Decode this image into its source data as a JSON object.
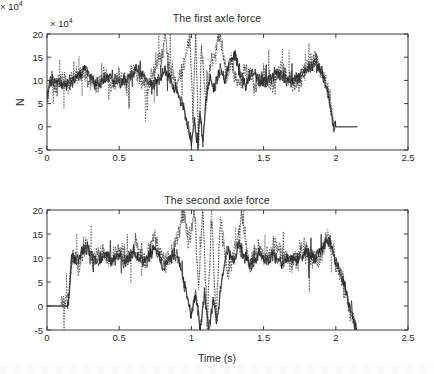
{
  "figure": {
    "background": "#ffffff",
    "ink_color": "#1c1c1c",
    "axis_color": "#3a3a3a"
  },
  "chart_data": [
    {
      "type": "line",
      "title": "The first axle force",
      "xlabel": "",
      "ylabel": "N",
      "y_exponent_label": "× 10",
      "y_exponent_power": "4",
      "xlim": [
        0,
        2.5
      ],
      "ylim": [
        -5,
        20
      ],
      "xticks": [
        "0",
        "0.5",
        "1",
        "1.5",
        "2",
        "2.5"
      ],
      "xtick_values": [
        0,
        0.5,
        1,
        1.5,
        2,
        2.5
      ],
      "yticks": [
        "20",
        "15",
        "10",
        "5",
        "0",
        "-5"
      ],
      "ytick_values": [
        20,
        15,
        10,
        5,
        0,
        -5
      ],
      "grid": false,
      "legend": null,
      "series": [
        {
          "name": "measured-force-solid",
          "style": "solid",
          "description": "Noisy oscillating axle force signal starting near 7-10 at t=0, fluctuating about a mean of ~9-10 with heavy scatter, violent oscillation clipping the -5 to 20 bounds between t=0.95 and t=1.3, recovering to ~10 mean until t=1.97, then dropping abruptly to 0 and flat to t=2.15",
          "x": [
            0,
            0.02,
            0.05,
            0.08,
            0.12,
            0.16,
            0.2,
            0.24,
            0.27,
            0.3,
            0.34,
            0.38,
            0.42,
            0.46,
            0.5,
            0.54,
            0.58,
            0.62,
            0.66,
            0.7,
            0.74,
            0.78,
            0.82,
            0.86,
            0.9,
            0.94,
            0.97,
            1.0,
            1.02,
            1.04,
            1.06,
            1.08,
            1.1,
            1.13,
            1.16,
            1.2,
            1.23,
            1.26,
            1.3,
            1.34,
            1.38,
            1.42,
            1.46,
            1.5,
            1.55,
            1.6,
            1.65,
            1.7,
            1.75,
            1.8,
            1.85,
            1.9,
            1.94,
            1.97,
            1.98,
            2.0,
            2.08,
            2.15
          ],
          "y": [
            7.0,
            9.5,
            10.2,
            9.6,
            9.0,
            9.8,
            10.4,
            11.5,
            13.0,
            10.6,
            9.2,
            9.6,
            10.8,
            10.2,
            9.4,
            10.0,
            11.0,
            12.6,
            11.4,
            9.8,
            9.0,
            10.6,
            12.2,
            9.5,
            7.6,
            5.0,
            1.0,
            -3.5,
            2.0,
            -5.0,
            3.5,
            -4.0,
            6.0,
            10.5,
            8.0,
            12.5,
            10.0,
            13.5,
            15.5,
            11.0,
            9.0,
            12.0,
            10.4,
            9.6,
            10.8,
            11.6,
            10.2,
            9.8,
            11.0,
            12.2,
            13.8,
            12.0,
            8.0,
            3.0,
            0.5,
            0.0,
            0.0,
            0.0
          ]
        },
        {
          "name": "simulated-force-dotted",
          "style": "dotted",
          "description": "Overlaid dotted trace following the same mean trend with larger excursions; tall dotted spikes reaching the 20 ceiling near t=0.82, 1.0-1.1 and 1.2, and dipping below -5 near t=1.0-1.07",
          "x": [
            0,
            0.03,
            0.07,
            0.11,
            0.15,
            0.2,
            0.25,
            0.3,
            0.35,
            0.4,
            0.45,
            0.5,
            0.55,
            0.6,
            0.65,
            0.7,
            0.75,
            0.8,
            0.82,
            0.85,
            0.9,
            0.95,
            0.99,
            1.01,
            1.03,
            1.05,
            1.07,
            1.1,
            1.13,
            1.17,
            1.2,
            1.24,
            1.28,
            1.32,
            1.38,
            1.44,
            1.5,
            1.56,
            1.62,
            1.68,
            1.74,
            1.8,
            1.86,
            1.92,
            1.96,
            1.99,
            2.0
          ],
          "y": [
            5.5,
            10.5,
            8.6,
            10.6,
            8.4,
            11.4,
            12.0,
            9.4,
            8.6,
            11.2,
            9.0,
            10.6,
            9.2,
            13.2,
            10.0,
            8.2,
            12.8,
            16.0,
            20.0,
            12.0,
            9.0,
            14.0,
            20.0,
            2.0,
            20.0,
            -5.0,
            18.0,
            5.0,
            13.0,
            16.5,
            20.0,
            11.0,
            14.0,
            9.0,
            12.0,
            8.8,
            11.4,
            9.2,
            12.6,
            10.2,
            9.4,
            13.0,
            14.6,
            11.0,
            6.0,
            0.0,
            0.0
          ]
        }
      ]
    },
    {
      "type": "line",
      "title": "The second axle force",
      "xlabel": "Time (s)",
      "ylabel": "N",
      "y_exponent_label": "× 10",
      "y_exponent_power": "4",
      "xlim": [
        0,
        2.5
      ],
      "ylim": [
        -5,
        20
      ],
      "xticks": [
        "0",
        "0.5",
        "1",
        "1.5",
        "2",
        "2.5"
      ],
      "xtick_values": [
        0,
        0.5,
        1,
        1.5,
        2,
        2.5
      ],
      "yticks": [
        "20",
        "15",
        "10",
        "5",
        "0",
        "-5"
      ],
      "ytick_values": [
        20,
        15,
        10,
        5,
        0,
        -5
      ],
      "grid": false,
      "legend": null,
      "series": [
        {
          "name": "measured-force-solid",
          "style": "solid",
          "description": "Flat at 0 until t=0.15, then steps up to ~10 and oscillates about a mean of ~9-10 with heavy scatter; violent oscillation clipping -5 and 20 between t=0.95 and t=1.25; steady ~10 mean until t=2.0, then a sharp decline to -5 at t=2.15",
          "x": [
            0,
            0.05,
            0.1,
            0.14,
            0.15,
            0.17,
            0.2,
            0.24,
            0.28,
            0.32,
            0.36,
            0.4,
            0.45,
            0.5,
            0.55,
            0.6,
            0.65,
            0.7,
            0.75,
            0.8,
            0.85,
            0.9,
            0.94,
            0.97,
            1.0,
            1.03,
            1.06,
            1.09,
            1.12,
            1.15,
            1.18,
            1.21,
            1.25,
            1.29,
            1.33,
            1.37,
            1.42,
            1.47,
            1.52,
            1.57,
            1.62,
            1.68,
            1.74,
            1.8,
            1.86,
            1.92,
            1.96,
            2.0,
            2.04,
            2.08,
            2.12,
            2.15
          ],
          "y": [
            0,
            0,
            0,
            0,
            0.5,
            10.5,
            9.0,
            11.0,
            12.5,
            10.0,
            9.4,
            10.8,
            9.2,
            10.4,
            9.0,
            11.2,
            9.6,
            10.0,
            12.0,
            8.4,
            9.8,
            11.0,
            6.0,
            2.0,
            -2.0,
            3.0,
            -5.0,
            2.5,
            -4.5,
            1.0,
            -3.0,
            6.0,
            12.0,
            9.0,
            13.5,
            10.0,
            8.6,
            11.0,
            9.2,
            10.6,
            8.8,
            10.2,
            9.6,
            11.4,
            10.0,
            12.8,
            13.5,
            9.0,
            6.5,
            2.0,
            -2.5,
            -5.0
          ]
        },
        {
          "name": "simulated-force-dotted",
          "style": "dotted",
          "description": "Dotted overlay rising from 0 at t=0.15 with a scattered ramp; follows the same mean and produces tall spikes touching 20 near t=0.95, 1.05-1.15 and 1.35, and deep dips beyond -5 near t=1.05-1.2",
          "x": [
            0,
            0.1,
            0.15,
            0.16,
            0.18,
            0.22,
            0.27,
            0.32,
            0.38,
            0.44,
            0.5,
            0.56,
            0.62,
            0.68,
            0.74,
            0.78,
            0.84,
            0.9,
            0.95,
            0.98,
            1.02,
            1.05,
            1.08,
            1.11,
            1.14,
            1.17,
            1.2,
            1.25,
            1.3,
            1.35,
            1.4,
            1.46,
            1.52,
            1.58,
            1.64,
            1.7,
            1.76,
            1.82,
            1.88,
            1.94,
            1.98,
            2.04,
            2.1,
            2.14
          ],
          "y": [
            0,
            0,
            2.0,
            6.0,
            11.5,
            8.0,
            13.0,
            9.5,
            11.8,
            9.0,
            12.2,
            10.0,
            13.4,
            9.2,
            15.0,
            11.0,
            9.0,
            14.0,
            19.5,
            13.0,
            20.0,
            4.0,
            20.0,
            -5.0,
            20.0,
            -4.0,
            18.0,
            7.0,
            11.0,
            19.0,
            8.0,
            12.4,
            9.6,
            13.0,
            10.2,
            9.0,
            12.0,
            10.8,
            9.4,
            14.2,
            11.5,
            5.0,
            -1.0,
            -4.5
          ]
        }
      ]
    }
  ]
}
